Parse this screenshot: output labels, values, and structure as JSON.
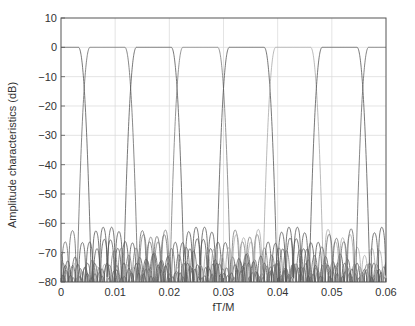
{
  "chart_data": {
    "type": "line",
    "title": "",
    "xlabel": "fT/M",
    "ylabel": "Amplitude characteristics (dB)",
    "xlim": [
      0,
      0.06
    ],
    "ylim": [
      -80,
      10
    ],
    "xticks": [
      0,
      0.01,
      0.02,
      0.03,
      0.04,
      0.05,
      0.06
    ],
    "xtick_labels": [
      "0",
      "0.01",
      "0.02",
      "0.03",
      "0.04",
      "0.05",
      "0.06"
    ],
    "yticks": [
      10,
      0,
      -10,
      -20,
      -30,
      -40,
      -50,
      -60,
      -70,
      -80
    ],
    "ytick_labels": [
      "10",
      "0",
      "−10",
      "−20",
      "−30",
      "−40",
      "−50",
      "−60",
      "−70",
      "−80"
    ],
    "grid": true,
    "legend": null,
    "channel_spacing": 0.008571,
    "passband_level_db": 0,
    "peak_sidelobe_db": -58,
    "stopband_floor_db": -80,
    "series": [
      {
        "name": "channel 0",
        "center": 0.0,
        "passband": [
          0.0,
          0.0032
        ],
        "crossover_db": -3,
        "color": "#555555"
      },
      {
        "name": "channel 1",
        "center": 0.00857,
        "passband": [
          0.0054,
          0.0118
        ],
        "color": "#6a6a6a"
      },
      {
        "name": "channel 2",
        "center": 0.01714,
        "passband": [
          0.0139,
          0.0203
        ],
        "color": "#555555"
      },
      {
        "name": "channel 3",
        "center": 0.02571,
        "passband": [
          0.0225,
          0.0289
        ],
        "color": "#7a7a7a"
      },
      {
        "name": "channel 4",
        "center": 0.03429,
        "passband": [
          0.0311,
          0.0375
        ],
        "color": "#555555"
      },
      {
        "name": "channel 5",
        "center": 0.04286,
        "passband": [
          0.0396,
          0.046
        ],
        "color": "#a8a8a8"
      },
      {
        "name": "channel 6",
        "center": 0.05143,
        "passband": [
          0.0482,
          0.0546
        ],
        "color": "#555555"
      },
      {
        "name": "channel 7",
        "center": 0.06,
        "passband": [
          0.0568,
          0.06
        ],
        "color": "#666666"
      }
    ]
  },
  "plot": {
    "frame": {
      "left": 61,
      "right": 386,
      "top": 18,
      "bottom": 282
    }
  }
}
